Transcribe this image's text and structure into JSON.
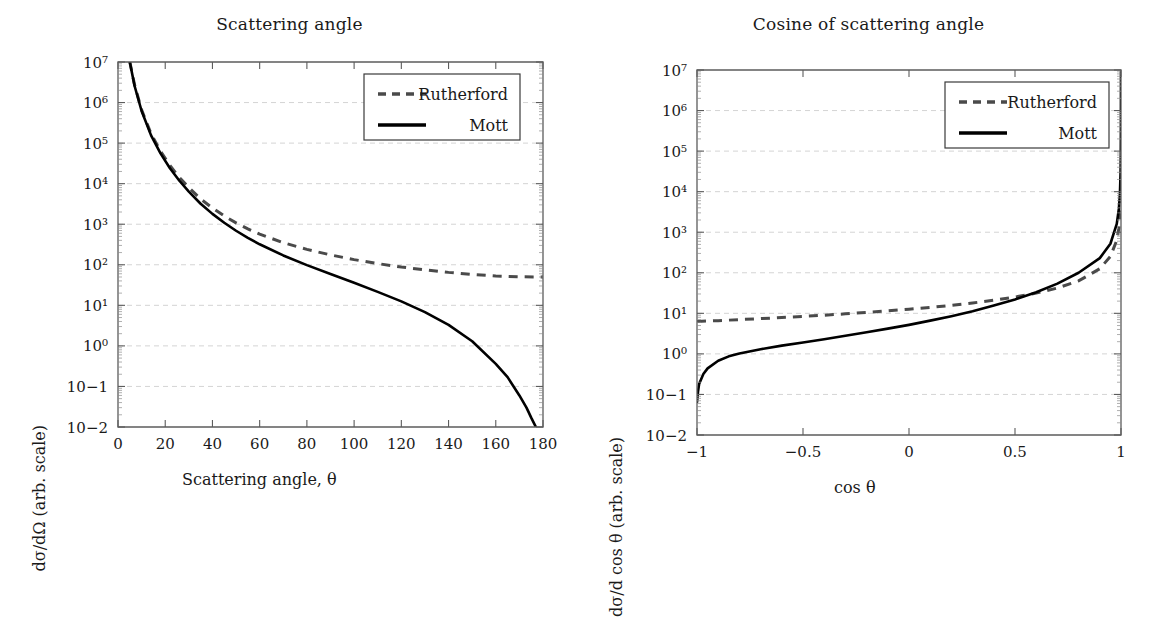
{
  "figure": {
    "background": "#ffffff",
    "width": 1158,
    "height": 521,
    "mott_color": "#000000",
    "rutherford_color": "#4a4a4a",
    "grid_color": "#cfcfcf",
    "axis_color": "#5c5c5c"
  },
  "panels": {
    "left": {
      "title": "Scattering angle",
      "xlabel": "Scattering angle, θ",
      "ylabel": "dσ/dΩ (arb. scale)",
      "xticklabels": [
        "0",
        "20",
        "40",
        "60",
        "80",
        "100",
        "120",
        "140",
        "160",
        "180"
      ],
      "yticklabels": [
        "10−2",
        "10−1",
        "10⁰",
        "10¹",
        "10²",
        "10³",
        "10⁴",
        "10⁵",
        "10⁶",
        "10⁷"
      ],
      "legend": [
        {
          "label": "Rutherford",
          "style": "dashed",
          "color": "#4a4a4a"
        },
        {
          "label": "Mott",
          "style": "solid",
          "color": "#000000"
        }
      ]
    },
    "right": {
      "title": "Cosine of scattering angle",
      "xlabel": "cos θ",
      "ylabel": "dσ/d cos θ (arb. scale)",
      "xticklabels": [
        "−1",
        "−0.5",
        "0",
        "0.5",
        "1"
      ],
      "yticklabels": [
        "10−2",
        "10−1",
        "10⁰",
        "10¹",
        "10²",
        "10³",
        "10⁴",
        "10⁵",
        "10⁶",
        "10⁷"
      ],
      "legend": [
        {
          "label": "Rutherford",
          "style": "dashed",
          "color": "#4a4a4a"
        },
        {
          "label": "Mott",
          "style": "solid",
          "color": "#000000"
        }
      ]
    }
  },
  "chart_data": [
    {
      "type": "line",
      "title": "Scattering angle",
      "xlabel": "Scattering angle, θ",
      "ylabel": "dσ/dΩ (arb. scale)",
      "xlim": [
        0,
        180
      ],
      "ylim": [
        0.01,
        10000000
      ],
      "yscale": "log",
      "xscale": "linear",
      "grid": true,
      "legend_position": "upper right",
      "xticks": [
        0,
        20,
        40,
        60,
        80,
        100,
        120,
        140,
        160,
        180
      ],
      "yticks": [
        0.01,
        0.1,
        1,
        10,
        100,
        1000,
        10000,
        100000,
        1000000,
        10000000
      ],
      "series": [
        {
          "name": "Rutherford",
          "style": "dashed",
          "color": "#4a4a4a",
          "x": [
            5,
            7,
            10,
            14,
            18,
            22,
            26,
            30,
            35,
            40,
            45,
            50,
            55,
            60,
            70,
            80,
            90,
            100,
            110,
            120,
            130,
            140,
            150,
            160,
            170,
            180
          ],
          "y": [
            10500000.0,
            2750000.0,
            660000.0,
            170000.0,
            63000.0,
            28000.0,
            14200.0,
            8000,
            4200,
            2500,
            1600,
            1080,
            770,
            570,
            350,
            240,
            175,
            134,
            107,
            88,
            75,
            65,
            58,
            53,
            50.5,
            50
          ]
        },
        {
          "name": "Mott",
          "style": "solid",
          "color": "#000000",
          "x": [
            5,
            7,
            10,
            14,
            18,
            22,
            26,
            30,
            35,
            40,
            45,
            50,
            55,
            60,
            70,
            80,
            90,
            100,
            110,
            120,
            130,
            140,
            150,
            160,
            165,
            170,
            173,
            175,
            176,
            177
          ],
          "y": [
            10000000.0,
            2600000.0,
            620000.0,
            155000.0,
            56000.0,
            24000.0,
            11800.0,
            6400,
            3200,
            1800,
            1090,
            690,
            460,
            320,
            170,
            98,
            59,
            36,
            21.5,
            12.5,
            6.8,
            3.3,
            1.3,
            0.36,
            0.17,
            0.06,
            0.03,
            0.017,
            0.013,
            0.01
          ]
        }
      ]
    },
    {
      "type": "line",
      "title": "Cosine of scattering angle",
      "xlabel": "cos θ",
      "ylabel": "dσ/d cos θ (arb. scale)",
      "xlim": [
        -1,
        1
      ],
      "ylim": [
        0.01,
        10000000
      ],
      "yscale": "log",
      "xscale": "linear",
      "grid": true,
      "legend_position": "upper right",
      "xticks": [
        -1,
        -0.5,
        0,
        0.5,
        1
      ],
      "yticks": [
        0.01,
        0.1,
        1,
        10,
        100,
        1000,
        10000,
        100000,
        1000000,
        10000000
      ],
      "series": [
        {
          "name": "Rutherford",
          "style": "dashed",
          "color": "#4a4a4a",
          "x": [
            -1,
            -0.95,
            -0.9,
            -0.8,
            -0.7,
            -0.6,
            -0.5,
            -0.4,
            -0.3,
            -0.2,
            -0.1,
            0,
            0.1,
            0.2,
            0.3,
            0.4,
            0.5,
            0.6,
            0.7,
            0.8,
            0.9,
            0.95,
            0.98,
            0.99,
            0.995,
            0.998,
            0.999,
            0.9995
          ],
          "y": [
            6.3,
            6.45,
            6.6,
            7.0,
            7.4,
            7.9,
            8.4,
            9.0,
            9.7,
            10.5,
            11.5,
            12.6,
            14.0,
            15.7,
            18.0,
            21.0,
            25.2,
            31.5,
            42,
            63,
            126,
            252,
            630,
            1260,
            2520,
            6300,
            12600,
            25000
          ]
        },
        {
          "name": "Mott",
          "style": "solid",
          "color": "#000000",
          "x": [
            -1,
            -0.995,
            -0.99,
            -0.97,
            -0.95,
            -0.9,
            -0.85,
            -0.8,
            -0.7,
            -0.6,
            -0.5,
            -0.4,
            -0.3,
            -0.2,
            -0.1,
            0,
            0.1,
            0.2,
            0.3,
            0.4,
            0.5,
            0.6,
            0.7,
            0.8,
            0.9,
            0.95,
            0.98,
            0.99,
            0.995,
            0.998,
            0.999,
            0.9995,
            0.9999
          ],
          "y": [
            0.065,
            0.12,
            0.18,
            0.32,
            0.44,
            0.68,
            0.87,
            1.02,
            1.3,
            1.6,
            1.9,
            2.3,
            2.8,
            3.4,
            4.2,
            5.2,
            6.6,
            8.5,
            11.2,
            15.5,
            22,
            33,
            54,
            100,
            230,
            520,
            1600,
            3800,
            9000,
            30000,
            90000,
            300000,
            9000000
          ]
        }
      ]
    }
  ]
}
